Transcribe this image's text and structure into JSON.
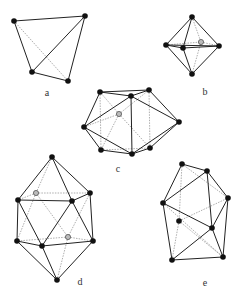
{
  "figures": [
    {
      "id": "a",
      "label": "a",
      "label_pos": [
        47,
        92
      ],
      "vertices": {
        "A": [
          14,
          21,
          "black"
        ],
        "B": [
          85,
          16,
          "black"
        ],
        "C": [
          32,
          72,
          "black"
        ],
        "D": [
          68,
          81,
          "black"
        ]
      },
      "solid": [
        [
          "A",
          "B"
        ],
        [
          "A",
          "C"
        ],
        [
          "C",
          "D"
        ],
        [
          "D",
          "B"
        ],
        [
          "C",
          "B"
        ]
      ],
      "dashed": [
        [
          "A",
          "D"
        ]
      ]
    },
    {
      "id": "b",
      "label": "b",
      "label_pos": [
        205,
        91
      ],
      "vertices": {
        "T": [
          192,
          17,
          "black"
        ],
        "L": [
          166,
          45,
          "black"
        ],
        "F": [
          183,
          48,
          "black"
        ],
        "K": [
          201,
          42,
          "gray"
        ],
        "R": [
          219,
          46,
          "black"
        ],
        "M": [
          192,
          74,
          "black"
        ]
      },
      "solid": [
        [
          "T",
          "L"
        ],
        [
          "T",
          "F"
        ],
        [
          "T",
          "R"
        ],
        [
          "L",
          "F"
        ],
        [
          "F",
          "R"
        ],
        [
          "L",
          "M"
        ],
        [
          "F",
          "M"
        ],
        [
          "R",
          "M"
        ],
        [
          "L",
          "R"
        ]
      ],
      "dashed": [
        [
          "T",
          "K"
        ],
        [
          "K",
          "M"
        ],
        [
          "L",
          "K"
        ],
        [
          "K",
          "R"
        ]
      ]
    },
    {
      "id": "c",
      "label": "c",
      "label_pos": [
        118,
        168
      ],
      "vertices": {
        "P1": [
          100,
          92,
          "black"
        ],
        "P2": [
          131,
          96,
          "black"
        ],
        "P3": [
          149,
          90,
          "black"
        ],
        "G": [
          119,
          114,
          "gray"
        ],
        "L": [
          84,
          127,
          "black"
        ],
        "R": [
          179,
          122,
          "black"
        ],
        "B1": [
          101,
          150,
          "black"
        ],
        "B2": [
          132,
          154,
          "black"
        ],
        "B3": [
          150,
          148,
          "black"
        ]
      },
      "solid": [
        [
          "P1",
          "P2"
        ],
        [
          "P1",
          "P3"
        ],
        [
          "P2",
          "P3"
        ],
        [
          "P1",
          "L"
        ],
        [
          "P2",
          "L"
        ],
        [
          "P2",
          "R"
        ],
        [
          "P3",
          "R"
        ],
        [
          "P2",
          "B2"
        ],
        [
          "L",
          "B1"
        ],
        [
          "L",
          "B2"
        ],
        [
          "B1",
          "B2"
        ],
        [
          "B2",
          "B3"
        ],
        [
          "B2",
          "R"
        ],
        [
          "B3",
          "R"
        ]
      ],
      "dashed": [
        [
          "P1",
          "B1"
        ],
        [
          "P3",
          "B3"
        ],
        [
          "G",
          "P1"
        ],
        [
          "G",
          "P3"
        ],
        [
          "G",
          "L"
        ],
        [
          "G",
          "B1"
        ],
        [
          "G",
          "B3"
        ],
        [
          "B1",
          "B3"
        ]
      ]
    },
    {
      "id": "d",
      "label": "d",
      "label_pos": [
        80,
        281
      ],
      "vertices": {
        "T": [
          52,
          157,
          "black"
        ],
        "UG": [
          36,
          193,
          "gray"
        ],
        "UL": [
          18,
          200,
          "black"
        ],
        "UM": [
          72,
          201,
          "black"
        ],
        "UR": [
          90,
          193,
          "black"
        ],
        "LL": [
          17,
          241,
          "black"
        ],
        "LG": [
          68,
          237,
          "gray"
        ],
        "LM": [
          42,
          246,
          "black"
        ],
        "LR": [
          93,
          241,
          "black"
        ],
        "B": [
          57,
          280,
          "black"
        ]
      },
      "solid": [
        [
          "T",
          "UL"
        ],
        [
          "T",
          "UM"
        ],
        [
          "T",
          "UR"
        ],
        [
          "UL",
          "UM"
        ],
        [
          "UM",
          "UR"
        ],
        [
          "UL",
          "LL"
        ],
        [
          "UL",
          "LM"
        ],
        [
          "UM",
          "LM"
        ],
        [
          "UM",
          "LR"
        ],
        [
          "UR",
          "LR"
        ],
        [
          "LL",
          "LM"
        ],
        [
          "LM",
          "LR"
        ],
        [
          "LL",
          "B"
        ],
        [
          "LM",
          "B"
        ],
        [
          "LR",
          "B"
        ]
      ],
      "dashed": [
        [
          "T",
          "UG"
        ],
        [
          "UG",
          "UL"
        ],
        [
          "UG",
          "UR"
        ],
        [
          "UG",
          "LL"
        ],
        [
          "UG",
          "LG"
        ],
        [
          "UR",
          "LG"
        ],
        [
          "LG",
          "LL"
        ],
        [
          "LG",
          "LR"
        ],
        [
          "LG",
          "B"
        ]
      ]
    },
    {
      "id": "e",
      "label": "e",
      "label_pos": [
        205,
        282
      ],
      "vertices": {
        "A": [
          182,
          164,
          "black"
        ],
        "B": [
          207,
          171,
          "black"
        ],
        "C": [
          228,
          198,
          "black"
        ],
        "D": [
          163,
          203,
          "black"
        ],
        "E": [
          179,
          221,
          "black"
        ],
        "F": [
          212,
          228,
          "black"
        ],
        "G": [
          172,
          260,
          "black"
        ],
        "H": [
          223,
          257,
          "black"
        ]
      },
      "solid": [
        [
          "A",
          "B"
        ],
        [
          "A",
          "D"
        ],
        [
          "B",
          "D"
        ],
        [
          "B",
          "F"
        ],
        [
          "B",
          "C"
        ],
        [
          "C",
          "H"
        ],
        [
          "C",
          "F"
        ],
        [
          "D",
          "F"
        ],
        [
          "D",
          "G"
        ],
        [
          "F",
          "G"
        ],
        [
          "F",
          "H"
        ],
        [
          "G",
          "H"
        ]
      ],
      "dashed": [
        [
          "A",
          "E"
        ],
        [
          "A",
          "C"
        ],
        [
          "E",
          "C"
        ],
        [
          "E",
          "G"
        ],
        [
          "E",
          "H"
        ],
        [
          "D",
          "H"
        ]
      ]
    }
  ]
}
